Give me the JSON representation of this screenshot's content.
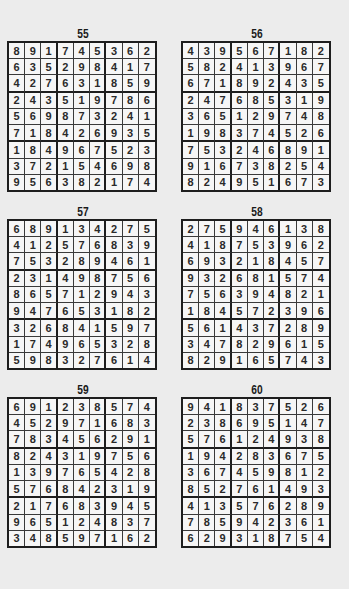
{
  "puzzles": [
    {
      "number": "55",
      "grid": [
        [
          8,
          9,
          1,
          7,
          4,
          5,
          3,
          6,
          2
        ],
        [
          6,
          3,
          5,
          2,
          9,
          8,
          4,
          1,
          7
        ],
        [
          4,
          2,
          7,
          6,
          3,
          1,
          8,
          5,
          9
        ],
        [
          2,
          4,
          3,
          5,
          1,
          9,
          7,
          8,
          6
        ],
        [
          5,
          6,
          9,
          8,
          7,
          3,
          2,
          4,
          1
        ],
        [
          7,
          1,
          8,
          4,
          2,
          6,
          9,
          3,
          5
        ],
        [
          1,
          8,
          4,
          9,
          6,
          7,
          5,
          2,
          3
        ],
        [
          3,
          7,
          2,
          1,
          5,
          4,
          6,
          9,
          8
        ],
        [
          9,
          5,
          6,
          3,
          8,
          2,
          1,
          7,
          4
        ]
      ]
    },
    {
      "number": "56",
      "grid": [
        [
          4,
          3,
          9,
          5,
          6,
          7,
          1,
          8,
          2
        ],
        [
          5,
          8,
          2,
          4,
          1,
          3,
          9,
          6,
          7
        ],
        [
          6,
          7,
          1,
          8,
          9,
          2,
          4,
          3,
          5
        ],
        [
          2,
          4,
          7,
          6,
          8,
          5,
          3,
          1,
          9
        ],
        [
          3,
          6,
          5,
          1,
          2,
          9,
          7,
          4,
          8
        ],
        [
          1,
          9,
          8,
          3,
          7,
          4,
          5,
          2,
          6
        ],
        [
          7,
          5,
          3,
          2,
          4,
          6,
          8,
          9,
          1
        ],
        [
          9,
          1,
          6,
          7,
          3,
          8,
          2,
          5,
          4
        ],
        [
          8,
          2,
          4,
          9,
          5,
          1,
          6,
          7,
          3
        ]
      ]
    },
    {
      "number": "57",
      "grid": [
        [
          6,
          8,
          9,
          1,
          3,
          4,
          2,
          7,
          5
        ],
        [
          4,
          1,
          2,
          5,
          7,
          6,
          8,
          3,
          9
        ],
        [
          7,
          5,
          3,
          2,
          8,
          9,
          4,
          6,
          1
        ],
        [
          2,
          3,
          1,
          4,
          9,
          8,
          7,
          5,
          6
        ],
        [
          8,
          6,
          5,
          7,
          1,
          2,
          9,
          4,
          3
        ],
        [
          9,
          4,
          7,
          6,
          5,
          3,
          1,
          8,
          2
        ],
        [
          3,
          2,
          6,
          8,
          4,
          1,
          5,
          9,
          7
        ],
        [
          1,
          7,
          4,
          9,
          6,
          5,
          3,
          2,
          8
        ],
        [
          5,
          9,
          8,
          3,
          2,
          7,
          6,
          1,
          4
        ]
      ]
    },
    {
      "number": "58",
      "grid": [
        [
          2,
          7,
          5,
          9,
          4,
          6,
          1,
          3,
          8
        ],
        [
          4,
          1,
          8,
          7,
          5,
          3,
          9,
          6,
          2
        ],
        [
          6,
          9,
          3,
          2,
          1,
          8,
          4,
          5,
          7
        ],
        [
          9,
          3,
          2,
          6,
          8,
          1,
          5,
          7,
          4
        ],
        [
          7,
          5,
          6,
          3,
          9,
          4,
          8,
          2,
          1
        ],
        [
          1,
          8,
          4,
          5,
          7,
          2,
          3,
          9,
          6
        ],
        [
          5,
          6,
          1,
          4,
          3,
          7,
          2,
          8,
          9
        ],
        [
          3,
          4,
          7,
          8,
          2,
          9,
          6,
          1,
          5
        ],
        [
          8,
          2,
          9,
          1,
          6,
          5,
          7,
          4,
          3
        ]
      ]
    },
    {
      "number": "59",
      "grid": [
        [
          6,
          9,
          1,
          2,
          3,
          8,
          5,
          7,
          4
        ],
        [
          4,
          5,
          2,
          9,
          7,
          1,
          6,
          8,
          3
        ],
        [
          7,
          8,
          3,
          4,
          5,
          6,
          2,
          9,
          1
        ],
        [
          8,
          2,
          4,
          3,
          1,
          9,
          7,
          5,
          6
        ],
        [
          1,
          3,
          9,
          7,
          6,
          5,
          4,
          2,
          8
        ],
        [
          5,
          7,
          6,
          8,
          4,
          2,
          3,
          1,
          9
        ],
        [
          2,
          1,
          7,
          6,
          8,
          3,
          9,
          4,
          5
        ],
        [
          9,
          6,
          5,
          1,
          2,
          4,
          8,
          3,
          7
        ],
        [
          3,
          4,
          8,
          5,
          9,
          7,
          1,
          6,
          2
        ]
      ]
    },
    {
      "number": "60",
      "grid": [
        [
          9,
          4,
          1,
          8,
          3,
          7,
          5,
          2,
          6
        ],
        [
          2,
          3,
          8,
          6,
          9,
          5,
          1,
          4,
          7
        ],
        [
          5,
          7,
          6,
          1,
          2,
          4,
          9,
          3,
          8
        ],
        [
          1,
          9,
          4,
          2,
          8,
          3,
          6,
          7,
          5
        ],
        [
          3,
          6,
          7,
          4,
          5,
          9,
          8,
          1,
          2
        ],
        [
          8,
          5,
          2,
          7,
          6,
          1,
          4,
          9,
          3
        ],
        [
          4,
          1,
          3,
          5,
          7,
          6,
          2,
          8,
          9
        ],
        [
          7,
          8,
          5,
          9,
          4,
          2,
          3,
          6,
          1
        ],
        [
          6,
          2,
          9,
          3,
          1,
          8,
          7,
          5,
          4
        ]
      ]
    }
  ]
}
